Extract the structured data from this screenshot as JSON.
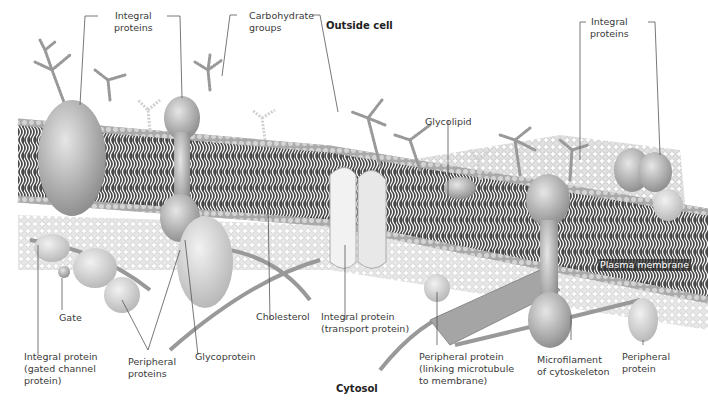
{
  "diagram": {
    "title_top": "Outside cell",
    "title_bottom": "Cytosol",
    "membrane_label": "Plasma membrane",
    "labels": {
      "integral_proteins_left": "Integral\nproteins",
      "carbohydrate_groups": "Carbohydrate\ngroups",
      "glycolipid": "Glycolipid",
      "integral_proteins_right": "Integral\nproteins",
      "gate": "Gate",
      "integral_protein_gated": "Integral protein\n(gated channel\nprotein)",
      "peripheral_proteins": "Peripheral\nproteins",
      "glycoprotein": "Glycoprotein",
      "cholesterol": "Cholesterol",
      "integral_protein_transport": "Integral protein\n(transport protein)",
      "peripheral_protein_linking": "Peripheral protein\n(linking microtubule\nto membrane)",
      "microfilament": "Microfilament\nof cytoskeleton",
      "peripheral_protein": "Peripheral\nprotein"
    }
  }
}
